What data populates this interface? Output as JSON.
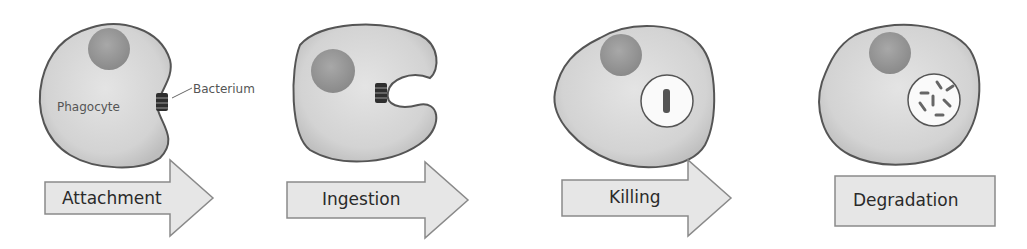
{
  "diagram": {
    "labels": {
      "phagocyte": "Phagocyte",
      "bacterium": "Bacterium"
    },
    "steps": [
      {
        "label": "Attachment",
        "shape": "arrow"
      },
      {
        "label": "Ingestion",
        "shape": "arrow"
      },
      {
        "label": "Killing",
        "shape": "arrow"
      },
      {
        "label": "Degradation",
        "shape": "box"
      }
    ],
    "colors": {
      "cell_fill": "#d6d6d6",
      "cell_stroke": "#555555",
      "nucleus_fill": "#9a9a9a",
      "bacterium_fill": "#2e2e2e",
      "arrow_fill": "#e6e6e6",
      "arrow_stroke": "#8a8a8a",
      "vacuole_fill": "#fafafa"
    }
  }
}
